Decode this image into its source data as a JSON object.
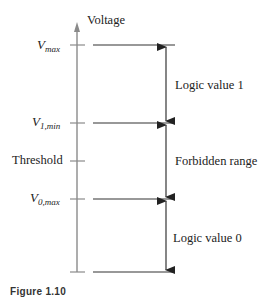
{
  "diagram": {
    "axis_label": "Voltage",
    "levels": [
      {
        "id": "vmax",
        "main": "V",
        "sub": "max",
        "y": 45
      },
      {
        "id": "v1min",
        "main": "V",
        "sub": "1,min",
        "y": 123
      },
      {
        "id": "threshold",
        "label": "Threshold",
        "y": 161
      },
      {
        "id": "v0max",
        "main": "V",
        "sub": "0,max",
        "y": 199
      },
      {
        "id": "bottom",
        "y": 272
      }
    ],
    "ranges": [
      {
        "label": "Logic value 1",
        "from": "V_max",
        "to": "V_1,min"
      },
      {
        "label": "Forbidden range",
        "from": "V_1,min",
        "to": "V_0,max"
      },
      {
        "label": "Logic value 0",
        "from": "V_0,max",
        "to": "bottom"
      }
    ],
    "caption": "Figure 1.10"
  },
  "colors": {
    "axis": "#8a8a8a",
    "line": "#333333",
    "text": "#222222"
  }
}
